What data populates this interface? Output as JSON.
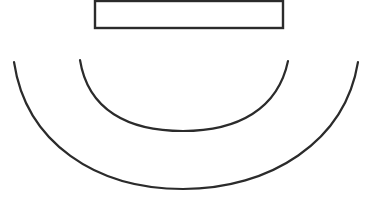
{
  "canvas": {
    "width": 367,
    "height": 208,
    "background_color": "#ffffff",
    "title": "Line drawing: rectangle above two nested downward arcs"
  },
  "figure": {
    "stroke_color": "#2b2b2b",
    "fill_color": "#ffffff",
    "shapes": [
      {
        "id": "top-rectangle",
        "type": "rectangle",
        "label": "Rectangle",
        "x": 95,
        "y": 1,
        "width": 188,
        "height": 27,
        "stroke_width": 2.4,
        "fill": "#fefefe",
        "stroke": "#2b2b2b"
      },
      {
        "id": "inner-arc",
        "type": "arc",
        "label": "Inner arc",
        "start_x": 80,
        "start_y": 60,
        "end_x": 288,
        "end_y": 61,
        "bottom_x": 183,
        "bottom_y": 131,
        "stroke_width": 2.2,
        "stroke": "#2b2b2b",
        "path": "M 80 60 C 88 110, 128 131, 183 131 C 238 131, 278 109, 288 61"
      },
      {
        "id": "outer-arc",
        "type": "arc",
        "label": "Outer arc",
        "start_x": 14,
        "start_y": 62,
        "end_x": 358,
        "end_y": 62,
        "bottom_x": 183,
        "bottom_y": 189,
        "stroke_width": 2.2,
        "stroke": "#2b2b2b",
        "path": "M 14 62 C 26 143, 96 189, 183 189 C 270 189, 345 142, 358 62"
      }
    ]
  }
}
